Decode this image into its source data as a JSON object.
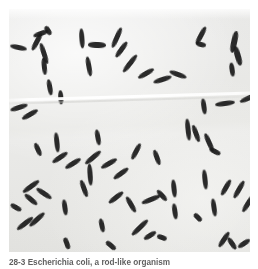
{
  "figure": {
    "name": "photomicrograph-plate",
    "background_color": "#e8e8e6",
    "cell_color": "#1b1b1b",
    "page_color": "#ffffff",
    "seam_note": "horizontal light seam across middle of print"
  },
  "caption": {
    "label": "28-3  Escherichia coli, a rod-like organism",
    "visible_note": "caption text clipped at bottom edge of screenshot"
  },
  "cells": [
    {
      "x": 1,
      "y": 36,
      "len": 17,
      "w": 5.0,
      "rot": 12
    },
    {
      "x": 18,
      "y": 30,
      "len": 20,
      "w": 5.2,
      "rot": -62
    },
    {
      "x": 24,
      "y": 22,
      "len": 16,
      "w": 5.4,
      "rot": -20
    },
    {
      "x": 34,
      "y": 19,
      "len": 10,
      "w": 5.2,
      "rot": 58
    },
    {
      "x": 24,
      "y": 42,
      "len": 22,
      "w": 5.0,
      "rot": 72
    },
    {
      "x": 27,
      "y": 55,
      "len": 17,
      "w": 4.6,
      "rot": 84
    },
    {
      "x": 33,
      "y": 76,
      "len": 16,
      "w": 4.6,
      "rot": 80
    },
    {
      "x": 45,
      "y": 86,
      "len": 14,
      "w": 4.6,
      "rot": 86
    },
    {
      "x": 63,
      "y": 27,
      "len": 20,
      "w": 4.8,
      "rot": 86
    },
    {
      "x": 79,
      "y": 33,
      "len": 18,
      "w": 5.6,
      "rot": 2
    },
    {
      "x": 70,
      "y": 55,
      "len": 20,
      "w": 4.8,
      "rot": 80
    },
    {
      "x": 97,
      "y": 26,
      "len": 22,
      "w": 5.4,
      "rot": -66
    },
    {
      "x": 103,
      "y": 38,
      "len": 19,
      "w": 5.2,
      "rot": -54
    },
    {
      "x": 110,
      "y": 52,
      "len": 22,
      "w": 5.0,
      "rot": -52
    },
    {
      "x": 128,
      "y": 62,
      "len": 18,
      "w": 5.0,
      "rot": -30
    },
    {
      "x": 144,
      "y": 68,
      "len": 19,
      "w": 5.0,
      "rot": -18
    },
    {
      "x": 160,
      "y": 63,
      "len": 18,
      "w": 5.0,
      "rot": 20
    },
    {
      "x": 182,
      "y": 24,
      "len": 20,
      "w": 5.2,
      "rot": -62
    },
    {
      "x": 187,
      "y": 33,
      "len": 10,
      "w": 4.8,
      "rot": 14
    },
    {
      "x": 214,
      "y": 30,
      "len": 22,
      "w": 5.6,
      "rot": -78
    },
    {
      "x": 219,
      "y": 44,
      "len": 20,
      "w": 5.6,
      "rot": 74
    },
    {
      "x": 216,
      "y": 58,
      "len": 14,
      "w": 5.2,
      "rot": 82
    },
    {
      "x": 230,
      "y": 86,
      "len": 22,
      "w": 5.4,
      "rot": -24
    },
    {
      "x": 245,
      "y": 78,
      "len": 18,
      "w": 5.0,
      "rot": -40
    },
    {
      "x": 206,
      "y": 92,
      "len": 20,
      "w": 5.0,
      "rot": -8
    },
    {
      "x": 187,
      "y": 95,
      "len": 16,
      "w": 4.8,
      "rot": 82
    },
    {
      "x": 1,
      "y": 96,
      "len": 18,
      "w": 5.0,
      "rot": -18
    },
    {
      "x": 12,
      "y": 103,
      "len": 18,
      "w": 5.2,
      "rot": -30
    },
    {
      "x": 168,
      "y": 118,
      "len": 22,
      "w": 5.2,
      "rot": 84
    },
    {
      "x": 178,
      "y": 122,
      "len": 18,
      "w": 5.0,
      "rot": 70
    },
    {
      "x": 190,
      "y": 131,
      "len": 20,
      "w": 5.2,
      "rot": 66
    },
    {
      "x": 200,
      "y": 140,
      "len": 12,
      "w": 4.8,
      "rot": 28
    },
    {
      "x": 22,
      "y": 138,
      "len": 14,
      "w": 4.8,
      "rot": 66
    },
    {
      "x": 42,
      "y": 146,
      "len": 18,
      "w": 5.0,
      "rot": -34
    },
    {
      "x": 55,
      "y": 152,
      "len": 18,
      "w": 5.0,
      "rot": -32
    },
    {
      "x": 38,
      "y": 131,
      "len": 20,
      "w": 4.8,
      "rot": 84
    },
    {
      "x": 81,
      "y": 126,
      "len": 16,
      "w": 4.8,
      "rot": 80
    },
    {
      "x": 74,
      "y": 146,
      "len": 20,
      "w": 5.0,
      "rot": -40
    },
    {
      "x": 91,
      "y": 152,
      "len": 18,
      "w": 5.0,
      "rot": -30
    },
    {
      "x": 70,
      "y": 163,
      "len": 22,
      "w": 5.2,
      "rot": 86
    },
    {
      "x": 66,
      "y": 177,
      "len": 18,
      "w": 5.0,
      "rot": 70
    },
    {
      "x": 103,
      "y": 162,
      "len": 18,
      "w": 5.0,
      "rot": -36
    },
    {
      "x": 118,
      "y": 140,
      "len": 18,
      "w": 4.8,
      "rot": -62
    },
    {
      "x": 140,
      "y": 146,
      "len": 16,
      "w": 4.8,
      "rot": 70
    },
    {
      "x": 12,
      "y": 175,
      "len": 20,
      "w": 5.0,
      "rot": -36
    },
    {
      "x": 26,
      "y": 182,
      "len": 18,
      "w": 5.0,
      "rot": 34
    },
    {
      "x": 14,
      "y": 188,
      "len": 16,
      "w": 5.0,
      "rot": 40
    },
    {
      "x": 98,
      "y": 186,
      "len": 18,
      "w": 5.0,
      "rot": -38
    },
    {
      "x": 6,
      "y": 212,
      "len": 20,
      "w": 5.0,
      "rot": -38
    },
    {
      "x": 18,
      "y": 208,
      "len": 20,
      "w": 5.0,
      "rot": -42
    },
    {
      "x": 132,
      "y": 188,
      "len": 20,
      "w": 5.0,
      "rot": -22
    },
    {
      "x": 113,
      "y": 193,
      "len": 18,
      "w": 5.0,
      "rot": 60
    },
    {
      "x": 146,
      "y": 184,
      "len": 14,
      "w": 4.8,
      "rot": 48
    },
    {
      "x": 156,
      "y": 177,
      "len": 18,
      "w": 5.0,
      "rot": 84
    },
    {
      "x": 186,
      "y": 168,
      "len": 20,
      "w": 5.0,
      "rot": 84
    },
    {
      "x": 158,
      "y": 200,
      "len": 16,
      "w": 4.8,
      "rot": 82
    },
    {
      "x": 196,
      "y": 196,
      "len": 18,
      "w": 5.0,
      "rot": 82
    },
    {
      "x": 208,
      "y": 176,
      "len": 18,
      "w": 5.0,
      "rot": -60
    },
    {
      "x": 220,
      "y": 178,
      "len": 20,
      "w": 5.0,
      "rot": -60
    },
    {
      "x": 229,
      "y": 192,
      "len": 20,
      "w": 5.0,
      "rot": -58
    },
    {
      "x": 1,
      "y": 196,
      "len": 12,
      "w": 4.8,
      "rot": 30
    },
    {
      "x": 48,
      "y": 196,
      "len": 16,
      "w": 4.8,
      "rot": 82
    },
    {
      "x": 86,
      "y": 214,
      "len": 14,
      "w": 4.8,
      "rot": 78
    },
    {
      "x": 120,
      "y": 216,
      "len": 22,
      "w": 5.4,
      "rot": -44
    },
    {
      "x": 134,
      "y": 224,
      "len": 14,
      "w": 5.0,
      "rot": -32
    },
    {
      "x": 148,
      "y": 226,
      "len": 10,
      "w": 4.6,
      "rot": 20
    },
    {
      "x": 184,
      "y": 206,
      "len": 10,
      "w": 4.6,
      "rot": 46
    },
    {
      "x": 206,
      "y": 228,
      "len": 18,
      "w": 5.0,
      "rot": -56
    },
    {
      "x": 216,
      "y": 232,
      "len": 14,
      "w": 5.0,
      "rot": 56
    },
    {
      "x": 228,
      "y": 232,
      "len": 14,
      "w": 5.0,
      "rot": -34
    },
    {
      "x": 52,
      "y": 232,
      "len": 12,
      "w": 4.6,
      "rot": 70
    },
    {
      "x": 96,
      "y": 234,
      "len": 12,
      "w": 4.6,
      "rot": 40
    }
  ]
}
